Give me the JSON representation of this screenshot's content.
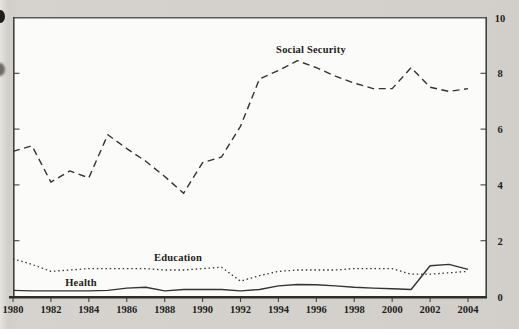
{
  "figure": {
    "paper_color": "#d2cfca",
    "plot_background": "#fbfbf9",
    "line_color": "#333330",
    "frame_color": "#4a4a47"
  },
  "chart_data": {
    "type": "line",
    "title": "",
    "xlabel": "",
    "ylabel": "",
    "xlim": [
      1980,
      2004
    ],
    "ylim": [
      0,
      10
    ],
    "grid": false,
    "legend_position": "inline-labels",
    "y_axis_side": "right",
    "x": [
      1980,
      1981,
      1982,
      1983,
      1984,
      1985,
      1986,
      1987,
      1988,
      1989,
      1990,
      1991,
      1992,
      1993,
      1994,
      1995,
      1996,
      1997,
      1998,
      1999,
      2000,
      2001,
      2002,
      2003,
      2004
    ],
    "series": [
      {
        "name": "Social Security",
        "style": "dashed",
        "values": [
          5.2,
          5.4,
          4.1,
          4.5,
          4.25,
          5.8,
          5.3,
          4.85,
          4.3,
          3.7,
          4.8,
          5.0,
          6.1,
          7.8,
          8.1,
          8.45,
          8.2,
          7.9,
          7.65,
          7.45,
          7.45,
          8.2,
          7.5,
          7.35,
          7.45
        ]
      },
      {
        "name": "Education",
        "style": "dotted",
        "values": [
          1.35,
          1.15,
          0.9,
          0.95,
          1.0,
          1.0,
          1.0,
          1.0,
          0.95,
          0.95,
          1.0,
          1.05,
          0.55,
          0.75,
          0.9,
          0.95,
          0.95,
          0.95,
          1.0,
          1.0,
          1.0,
          0.8,
          0.8,
          0.85,
          0.9
        ]
      },
      {
        "name": "Health",
        "style": "solid",
        "values": [
          0.22,
          0.2,
          0.2,
          0.2,
          0.2,
          0.22,
          0.3,
          0.33,
          0.2,
          0.25,
          0.25,
          0.25,
          0.2,
          0.25,
          0.38,
          0.43,
          0.42,
          0.38,
          0.33,
          0.3,
          0.28,
          0.25,
          1.1,
          1.15,
          0.97
        ]
      }
    ],
    "x_tick_years": [
      1980,
      1982,
      1984,
      1986,
      1988,
      1990,
      1992,
      1994,
      1996,
      1998,
      2000,
      2002,
      2004
    ],
    "x_tick_labels": [
      "1980",
      "1982",
      "1984",
      "1986",
      "1988",
      "1990",
      "1992",
      "1994",
      "1996",
      "1998",
      "2000",
      "2002",
      "2004"
    ],
    "y_tick_values": [
      0,
      2,
      4,
      6,
      8,
      10
    ],
    "y_tick_labels": [
      "0",
      "2",
      "4",
      "6",
      "8",
      "10"
    ]
  }
}
